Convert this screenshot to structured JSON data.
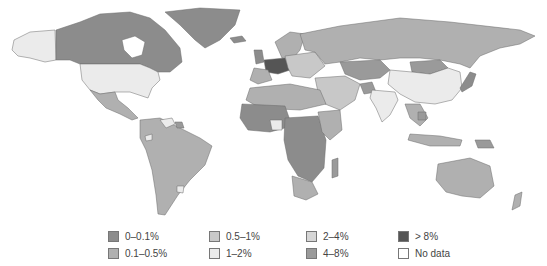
{
  "map": {
    "type": "choropleth-world",
    "colors": {
      "c0": "#8c8c8c",
      "c1": "#b0b0b0",
      "c2": "#c8c8c8",
      "c3": "#ebebeb",
      "c4": "#d6d6d6",
      "c5": "#9a9a9a",
      "c6": "#555555",
      "nodata": "#ffffff"
    }
  },
  "legend": {
    "items": [
      {
        "label": "0–0.1%",
        "color": "#8c8c8c"
      },
      {
        "label": "0.1–0.5%",
        "color": "#b0b0b0"
      },
      {
        "label": "0.5–1%",
        "color": "#c8c8c8"
      },
      {
        "label": "1–2%",
        "color": "#ebebeb"
      },
      {
        "label": "2–4%",
        "color": "#d6d6d6"
      },
      {
        "label": "4–8%",
        "color": "#9a9a9a"
      },
      {
        "label": "> 8%",
        "color": "#555555"
      },
      {
        "label": "No data",
        "color": "#ffffff"
      }
    ]
  }
}
